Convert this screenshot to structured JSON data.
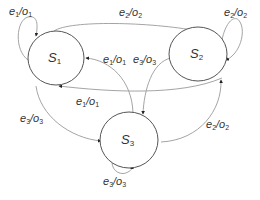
{
  "diagram": {
    "type": "state-machine",
    "colors": {
      "state_stroke": "#555555",
      "edge_stroke": "#9a9a9a",
      "arrow": "#222222",
      "text": "#333333"
    },
    "states": [
      {
        "id": "S1",
        "name": "S",
        "sub": "1",
        "cx": 56,
        "cy": 58,
        "rx": 28,
        "ry": 27
      },
      {
        "id": "S2",
        "name": "S",
        "sub": "2",
        "cx": 198,
        "cy": 54,
        "rx": 29,
        "ry": 27
      },
      {
        "id": "S3",
        "name": "S",
        "sub": "3",
        "cx": 129,
        "cy": 140,
        "rx": 29,
        "ry": 28
      }
    ],
    "transitions": [
      {
        "from": "S1",
        "to": "S1",
        "event": "e",
        "event_sub": "1",
        "output": "o",
        "output_sub": "1"
      },
      {
        "from": "S2",
        "to": "S2",
        "event": "e",
        "event_sub": "2",
        "output": "o",
        "output_sub": "2"
      },
      {
        "from": "S3",
        "to": "S3",
        "event": "e",
        "event_sub": "3",
        "output": "o",
        "output_sub": "3"
      },
      {
        "from": "S1",
        "to": "S2",
        "event": "e",
        "event_sub": "2",
        "output": "o",
        "output_sub": "2"
      },
      {
        "from": "S2",
        "to": "S1",
        "event": "e",
        "event_sub": "1",
        "output": "o",
        "output_sub": "1"
      },
      {
        "from": "S3",
        "to": "S1",
        "event": "e",
        "event_sub": "1",
        "output": "o",
        "output_sub": "1"
      },
      {
        "from": "S2",
        "to": "S3",
        "event": "e",
        "event_sub": "3",
        "output": "o",
        "output_sub": "3"
      },
      {
        "from": "S1",
        "to": "S3",
        "event": "e",
        "event_sub": "3",
        "output": "o",
        "output_sub": "3"
      },
      {
        "from": "S3",
        "to": "S2",
        "event": "e",
        "event_sub": "2",
        "output": "o",
        "output_sub": "2"
      }
    ]
  }
}
